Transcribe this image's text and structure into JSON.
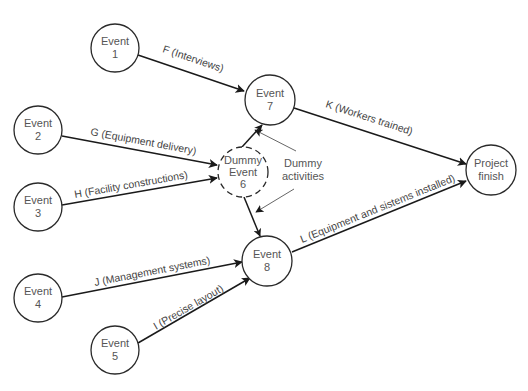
{
  "diagram": {
    "type": "activity-on-arrow network",
    "nodes": [
      {
        "id": "e1",
        "line1": "Event",
        "line2": "1",
        "x": 115,
        "y": 48,
        "r": 24,
        "dashed": false
      },
      {
        "id": "e2",
        "line1": "Event",
        "line2": "2",
        "x": 38,
        "y": 130,
        "r": 24,
        "dashed": false
      },
      {
        "id": "e3",
        "line1": "Event",
        "line2": "3",
        "x": 38,
        "y": 207,
        "r": 24,
        "dashed": false
      },
      {
        "id": "e4",
        "line1": "Event",
        "line2": "4",
        "x": 38,
        "y": 298,
        "r": 24,
        "dashed": false
      },
      {
        "id": "e5",
        "line1": "Event",
        "line2": "5",
        "x": 115,
        "y": 350,
        "r": 24,
        "dashed": false
      },
      {
        "id": "e6",
        "line1": "Dummy",
        "line2": "Event",
        "line3": "6",
        "x": 243,
        "y": 172,
        "r": 25,
        "dashed": true
      },
      {
        "id": "e7",
        "line1": "Event",
        "line2": "7",
        "x": 270,
        "y": 100,
        "r": 25,
        "dashed": false
      },
      {
        "id": "e8",
        "line1": "Event",
        "line2": "8",
        "x": 267,
        "y": 261,
        "r": 25,
        "dashed": false
      },
      {
        "id": "finish",
        "line1": "Project",
        "line2": "finish",
        "x": 491,
        "y": 170,
        "r": 25,
        "dashed": false
      }
    ],
    "edges": [
      {
        "from": "e1",
        "to": "e7",
        "label": "F (Interviews)"
      },
      {
        "from": "e2",
        "to": "e6",
        "label": "G (Equipment delivery)"
      },
      {
        "from": "e3",
        "to": "e6",
        "label": "H (Facility constructions)"
      },
      {
        "from": "e6",
        "to": "e7",
        "label": ""
      },
      {
        "from": "e6",
        "to": "e8",
        "label": ""
      },
      {
        "from": "e4",
        "to": "e8",
        "label": "J (Management systems)"
      },
      {
        "from": "e5",
        "to": "e8",
        "label": "I (Precise layout)"
      },
      {
        "from": "e7",
        "to": "finish",
        "label": "K (Workers trained)"
      },
      {
        "from": "e8",
        "to": "finish",
        "label": "L (Equipment and sistems installed)"
      }
    ],
    "annotation": {
      "line1": "Dummy",
      "line2": "activities"
    },
    "colors": {
      "stroke": "#1a1a1a",
      "text": "#555555",
      "background": "#ffffff"
    }
  }
}
